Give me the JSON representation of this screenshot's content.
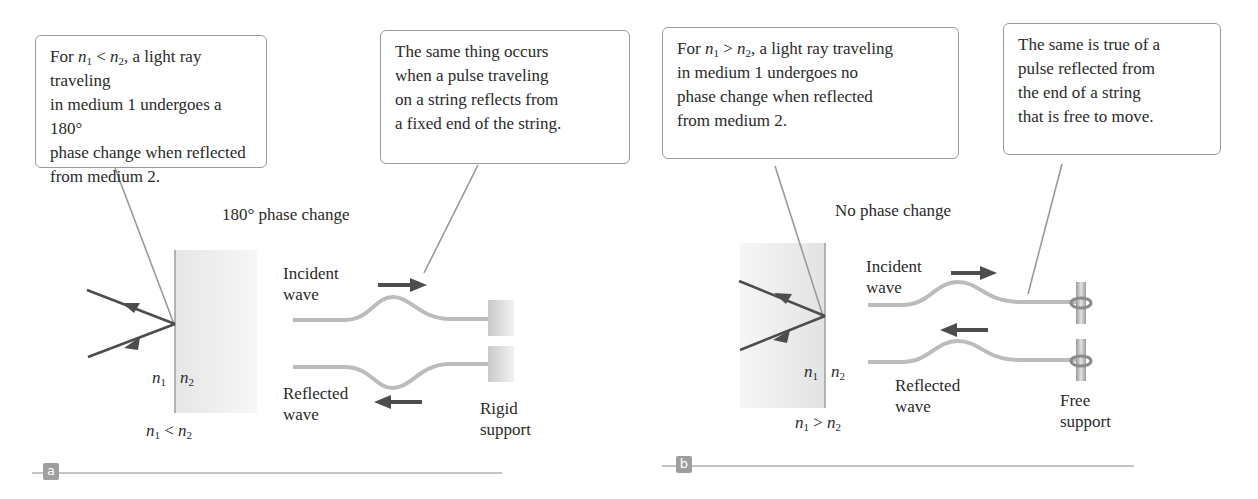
{
  "figure": {
    "panels": [
      {
        "id": "a",
        "tag": "a",
        "callout_left": {
          "lines": [
            {
              "pre": "For ",
              "var1": "n",
              "sub1": "1",
              "op": " < ",
              "var2": "n",
              "sub2": "2",
              "post": ", a light ray traveling"
            },
            "in medium 1 undergoes a 180°",
            "phase change when reflected",
            "from medium 2."
          ]
        },
        "callout_right": {
          "lines": [
            "The same thing occurs",
            "when a pulse traveling",
            "on a string reflects from",
            "a fixed end of the string."
          ]
        },
        "phase_label": "180° phase change",
        "incident_label": [
          "Incident",
          "wave"
        ],
        "reflected_label": [
          "Reflected",
          "wave"
        ],
        "support_label": [
          "Rigid",
          "support"
        ],
        "interface_labels": {
          "left": "n",
          "left_sub": "1",
          "right": "n",
          "right_sub": "2"
        },
        "condition": {
          "var1": "n",
          "sub1": "1",
          "op": " < ",
          "var2": "n",
          "sub2": "2"
        }
      },
      {
        "id": "b",
        "tag": "b",
        "callout_left": {
          "lines": [
            {
              "pre": "For ",
              "var1": "n",
              "sub1": "1",
              "op": " > ",
              "var2": "n",
              "sub2": "2",
              "post": ", a light ray traveling"
            },
            "in medium 1 undergoes no",
            "phase change when reflected",
            "from medium 2."
          ]
        },
        "callout_right": {
          "lines": [
            "The same is true of a",
            "pulse reflected from",
            "the end of a string",
            "that is free to move."
          ]
        },
        "phase_label": "No phase change",
        "incident_label": [
          "Incident",
          "wave"
        ],
        "reflected_label": [
          "Reflected",
          "wave"
        ],
        "support_label": [
          "Free",
          "support"
        ],
        "interface_labels": {
          "left": "n",
          "left_sub": "1",
          "right": "n",
          "right_sub": "2"
        },
        "condition": {
          "var1": "n",
          "sub1": "1",
          "op": " > ",
          "var2": "n",
          "sub2": "2"
        }
      }
    ],
    "colors": {
      "ray": "#505050",
      "string": "#b8b8b8",
      "medium": "#ededed",
      "callout_border": "#9a9a9a",
      "tag_bg": "#9e9e9e",
      "rule": "#c4c4c4"
    }
  }
}
